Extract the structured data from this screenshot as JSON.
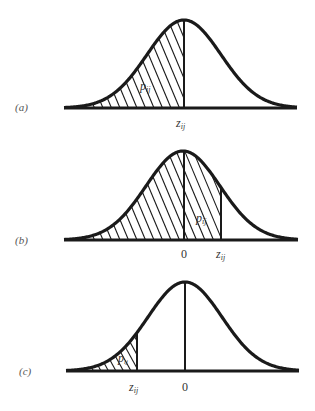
{
  "figure": {
    "panels": [
      {
        "id": "a",
        "label": "(a)",
        "shaded_region": "left of z_ij",
        "area_label": "p",
        "area_subscript": "ij",
        "x_labels": [
          {
            "text": "z",
            "sub": "ij"
          }
        ],
        "z_position": "at mean"
      },
      {
        "id": "b",
        "label": "(b)",
        "shaded_region": "left of z_ij",
        "area_label": "p",
        "area_subscript": "ij",
        "x_labels": [
          {
            "text": "0"
          },
          {
            "text": "z",
            "sub": "ij"
          }
        ],
        "z_position": "right of 0"
      },
      {
        "id": "c",
        "label": "(c)",
        "shaded_region": "left of z_ij",
        "area_label": "p",
        "area_subscript": "ij",
        "x_labels": [
          {
            "text": "z",
            "sub": "ij"
          },
          {
            "text": "0"
          }
        ],
        "z_position": "left of 0"
      }
    ]
  },
  "labels": {
    "a": "(a)",
    "b": "(b)",
    "c": "(c)",
    "zero": "0",
    "z": "z",
    "p": "p",
    "sub": "ij"
  },
  "colors": {
    "ink": "#1a1a1a",
    "background": "#ffffff"
  }
}
